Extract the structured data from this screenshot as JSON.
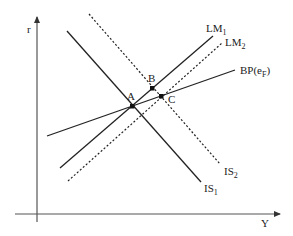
{
  "axes": {
    "y_label": "r",
    "x_label": "Y"
  },
  "curves": [
    {
      "id": "IS1",
      "label": "IS",
      "sub": "1",
      "style": "solid"
    },
    {
      "id": "IS2",
      "label": "IS",
      "sub": "2",
      "style": "dotted"
    },
    {
      "id": "LM1",
      "label": "LM",
      "sub": "1",
      "style": "solid"
    },
    {
      "id": "LM2",
      "label": "LM",
      "sub": "2",
      "style": "dotted"
    },
    {
      "id": "BP",
      "label": "BP(e",
      "sub": "F",
      "suffix": ")",
      "style": "solid"
    }
  ],
  "points": [
    {
      "id": "A",
      "label": "A"
    },
    {
      "id": "B",
      "label": "B"
    },
    {
      "id": "C",
      "label": "C"
    }
  ],
  "colors": {
    "line": "#222222",
    "axis": "#555555",
    "background": "#ffffff"
  }
}
